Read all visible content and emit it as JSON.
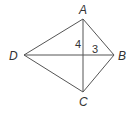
{
  "diagram": {
    "type": "kite",
    "stroke_color": "#555555",
    "vertices": {
      "A": {
        "label": "A",
        "x": 83,
        "y": 19
      },
      "B": {
        "label": "B",
        "x": 114,
        "y": 55
      },
      "C": {
        "label": "C",
        "x": 83,
        "y": 92
      },
      "D": {
        "label": "D",
        "x": 24,
        "y": 55
      }
    },
    "segment_labels": {
      "upper_vertical": "4",
      "right_horizontal": "3"
    }
  }
}
